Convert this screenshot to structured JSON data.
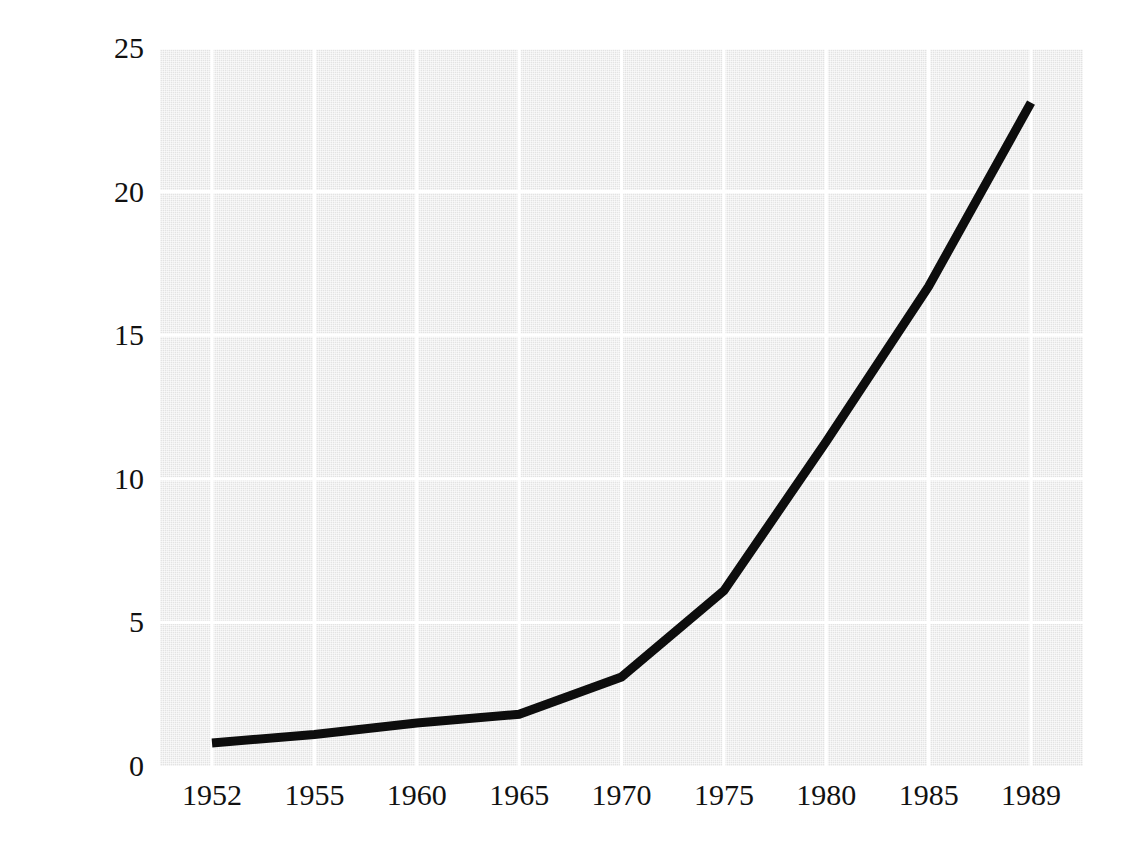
{
  "chart_data": {
    "type": "line",
    "title": "",
    "subtitle": "",
    "xlabel": "",
    "ylabel": "Millions of Dollars",
    "x": [
      1952,
      1955,
      1960,
      1965,
      1970,
      1975,
      1980,
      1985,
      1989
    ],
    "categories": [
      "1952",
      "1955",
      "1960",
      "1965",
      "1970",
      "1975",
      "1980",
      "1985",
      "1989"
    ],
    "values": [
      0.8,
      1.1,
      1.5,
      1.8,
      3.1,
      6.1,
      11.3,
      16.7,
      23.1
    ],
    "series": [
      {
        "name": "Millions of Dollars",
        "values": [
          0.8,
          1.1,
          1.5,
          1.8,
          3.1,
          6.1,
          11.3,
          16.7,
          23.1
        ]
      }
    ],
    "xtick_labels": [
      "1952",
      "1955",
      "1960",
      "1965",
      "1970",
      "1975",
      "1980",
      "1985",
      "1989"
    ],
    "ytick_labels": [
      "0",
      "5",
      "10",
      "15",
      "20",
      "25"
    ],
    "ytick_values": [
      0,
      5,
      10,
      15,
      20,
      25
    ],
    "ylim": [
      0,
      25
    ],
    "grid": "both",
    "legend": "none",
    "line_color": "#0d0d0d",
    "line_width": 9,
    "plot_background": "#e3e3e3",
    "gridline_color": "#ffffff",
    "text_color": "#111111"
  }
}
